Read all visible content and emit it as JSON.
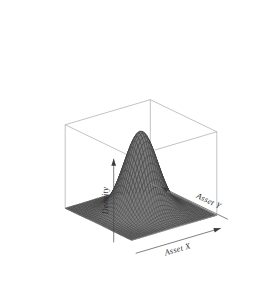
{
  "figure": {
    "type": "surface-3d-plot",
    "background_color": "#ffffff",
    "width": 278,
    "height": 286
  },
  "labels": {
    "x_axis": "Asset X",
    "y_axis": "Asset Y",
    "z_axis": "Density"
  },
  "style": {
    "box_line_color": "#9a9a9a",
    "axis_arrow_color": "#3a3a3a",
    "surface_fill_color": "#7d7d7d",
    "surface_mesh_color": "#3c3c3c",
    "label_color": "#2a2a2a"
  },
  "chart_data": {
    "type": "surface",
    "title": "",
    "xlabel": "Asset X",
    "ylabel": "Asset Y",
    "zlabel": "Density",
    "grid": false,
    "legend": "none",
    "axis_ticks": "none",
    "projection": {
      "theta_deg": -38,
      "phi_deg": 26,
      "box": true,
      "ticktype": "none"
    },
    "surface_function": "bivariate_normal",
    "parameters": {
      "mu_x": 0.0,
      "mu_y": 0.0,
      "sigma_x": 1.0,
      "sigma_y": 1.0,
      "rho": 0.0,
      "peak_density": 0.159
    },
    "xlim": [
      -3.2,
      3.2
    ],
    "ylim": [
      -3.2,
      3.2
    ],
    "zlim": [
      0,
      0.165
    ],
    "grid_n": 42,
    "x": [
      -3.2,
      -2.8,
      -2.4,
      -2.0,
      -1.6,
      -1.2,
      -0.8,
      -0.4,
      0.0,
      0.4,
      0.8,
      1.2,
      1.6,
      2.0,
      2.4,
      2.8,
      3.2
    ],
    "y": [
      -3.2,
      -2.8,
      -2.4,
      -2.0,
      -1.6,
      -1.2,
      -0.8,
      -0.4,
      0.0,
      0.4,
      0.8,
      1.2,
      1.6,
      2.0,
      2.4,
      2.8,
      3.2
    ],
    "z_profile_along_y0": [
      0.0023,
      0.0079,
      0.0224,
      0.054,
      0.1109,
      0.1518,
      0.1159,
      0.1469,
      0.1592,
      0.1469,
      0.1159,
      0.079,
      0.0461,
      0.0216,
      0.0079,
      0.0022,
      0.0005
    ]
  }
}
